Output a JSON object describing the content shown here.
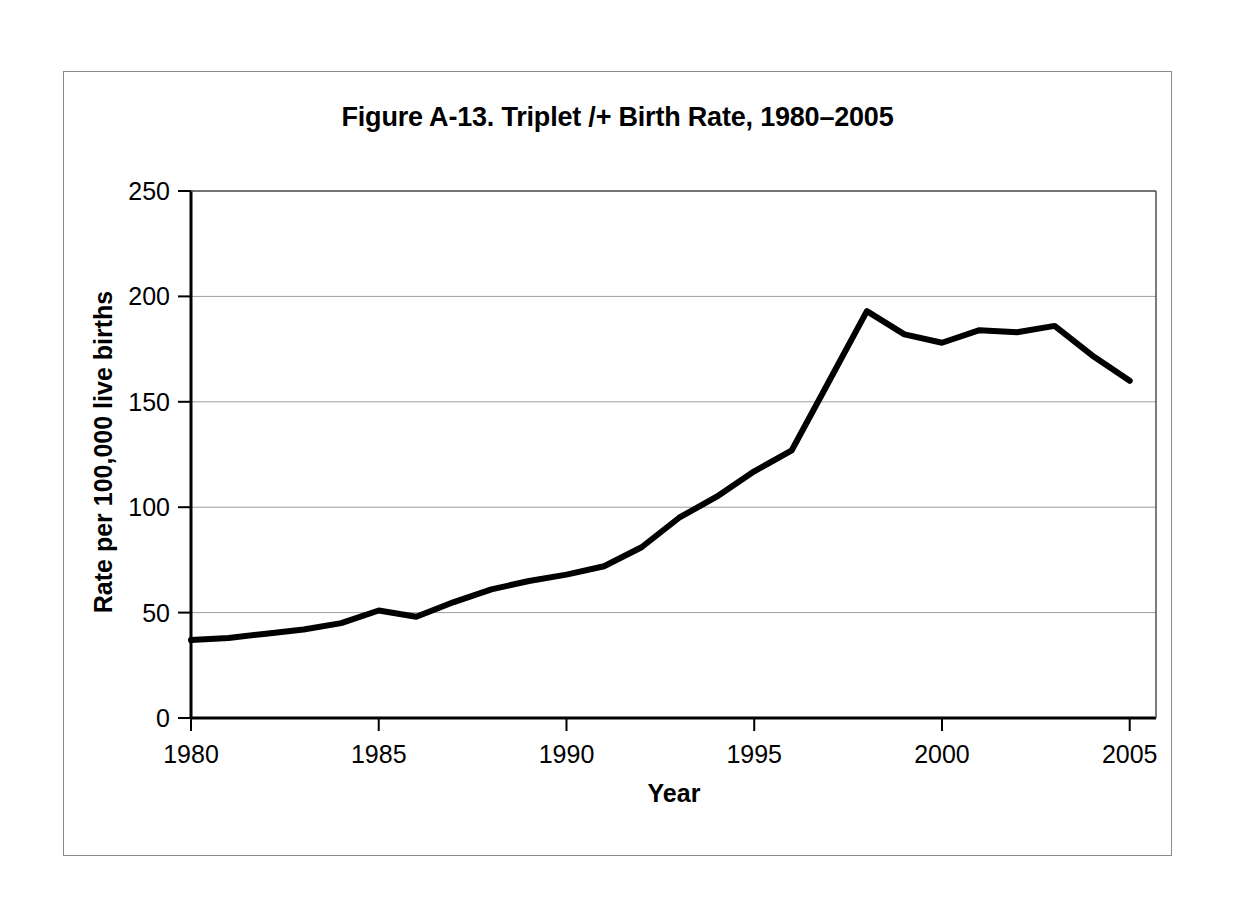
{
  "figure": {
    "title": "Figure A-13. Triplet /+ Birth Rate, 1980–2005",
    "background_color": "#ffffff",
    "frame_color": "#8a8a8a",
    "line_color": "#000000"
  },
  "chart_data": {
    "type": "line",
    "title": "Figure A-13. Triplet /+ Birth Rate, 1980–2005",
    "xlabel": "Year",
    "ylabel": "Rate per 100,000 live births",
    "xlim": [
      1980,
      2005.7
    ],
    "ylim": [
      0,
      250
    ],
    "xticks": [
      1980,
      1985,
      1990,
      1995,
      2000,
      2005
    ],
    "xtick_labels": [
      "1980",
      "1985",
      "1990",
      "1995",
      "2000",
      "2005"
    ],
    "yticks": [
      0,
      50,
      100,
      150,
      200,
      250
    ],
    "ytick_labels": [
      "0",
      "50",
      "100",
      "150",
      "200",
      "250"
    ],
    "grid": "horizontal",
    "legend": "none",
    "series": [
      {
        "name": "Triplet /+ birth rate",
        "x": [
          1980,
          1981,
          1982,
          1983,
          1984,
          1985,
          1986,
          1987,
          1988,
          1989,
          1990,
          1991,
          1992,
          1993,
          1994,
          1995,
          1996,
          1997,
          1998,
          1999,
          2000,
          2001,
          2002,
          2003,
          2004,
          2005
        ],
        "values": [
          37,
          38,
          40,
          42,
          45,
          51,
          48,
          55,
          61,
          65,
          68,
          72,
          81,
          95,
          105,
          117,
          127,
          160,
          193,
          182,
          178,
          184,
          183,
          186,
          172,
          160
        ]
      }
    ]
  }
}
